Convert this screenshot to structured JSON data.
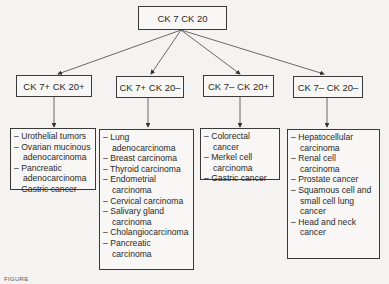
{
  "root": {
    "label": "CK 7 CK 20"
  },
  "branches": [
    {
      "label": "CK 7+ CK 20+",
      "items": [
        "Urothelial tumors",
        "Ovarian mucinous adenocarcinoma",
        "Pancreatic adenocarcinoma",
        "Gastric cancer"
      ]
    },
    {
      "label": "CK 7+ CK 20–",
      "items": [
        "Lung adenocarcinoma",
        "Breast carcinoma",
        "Thyroid carcinoma",
        "Endometrial carcinoma",
        "Cervical carcinoma",
        "Salivary gland carcinoma",
        "Cholangiocarcinoma",
        "Pancreatic carcinoma"
      ]
    },
    {
      "label": "CK 7– CK 20+",
      "items": [
        "Colorectal cancer",
        "Merkel cell carcinoma",
        "Gastric cancer"
      ]
    },
    {
      "label": "CK 7– CK 20–",
      "items": [
        "Hepatocellular carcinoma",
        "Renal cell carcinoma",
        "Prostate cancer",
        "Squamous cell and small cell lung cancer",
        "Head and neck cancer"
      ]
    }
  ],
  "caption": "FIGURE"
}
